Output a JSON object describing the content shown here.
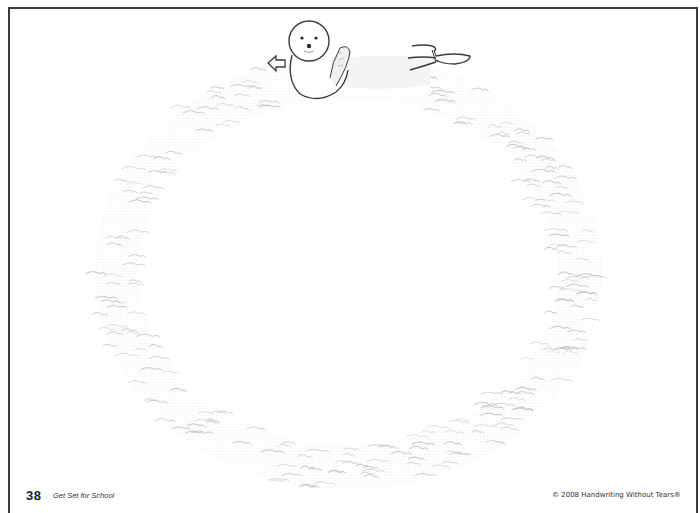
{
  "page": {
    "number": "38",
    "book_title": "Get Set for School",
    "copyright": "© 2008 Handwriting Without Tears®"
  },
  "illustration": {
    "subject": "seal swimming in a circular wave path",
    "direction_arrow": "left-arrow-icon",
    "ring": {
      "cx": 348,
      "cy": 272,
      "rx": 230,
      "ry": 195,
      "band_width": 46,
      "wave_color": "#b8b8b8"
    },
    "outline_color": "#3a3a3a"
  },
  "colors": {
    "background": "#ffffff",
    "frame": "#3a3a3a",
    "text": "#222222"
  }
}
